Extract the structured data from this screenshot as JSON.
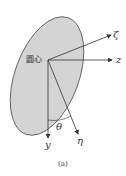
{
  "diagram": {
    "center_label": "圆心",
    "axes": {
      "zeta": "ζ",
      "z": "z",
      "y": "y",
      "eta": "η"
    },
    "angle_label": "θ",
    "caption": "(a)",
    "colors": {
      "ellipse_fill": "#d4d4d4",
      "stroke": "#444444"
    }
  }
}
